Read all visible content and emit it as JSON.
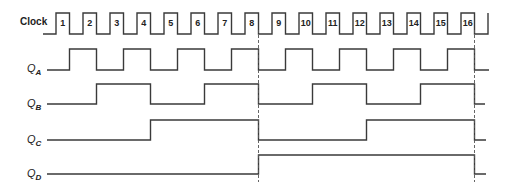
{
  "clock": {
    "label": "Clock",
    "pulse_numbers": [
      "1",
      "2",
      "3",
      "4",
      "5",
      "6",
      "7",
      "8",
      "9",
      "10",
      "11",
      "12",
      "13",
      "14",
      "15",
      "16"
    ]
  },
  "signals": [
    {
      "name": "Q",
      "subscript": "A",
      "toggles_every_pulses": 1
    },
    {
      "name": "Q",
      "subscript": "B",
      "toggles_every_pulses": 2
    },
    {
      "name": "Q",
      "subscript": "C",
      "toggles_every_pulses": 4
    },
    {
      "name": "Q",
      "subscript": "D",
      "toggles_every_pulses": 8
    }
  ],
  "markers": {
    "dashed_lines_after_pulses": [
      8,
      16
    ]
  },
  "geometry": {
    "clock_start_x": 43,
    "first_rise_x": 56,
    "period": 27,
    "pulse_width": 13.5,
    "clock_high_y": 13,
    "clock_low_y": 34,
    "signal_start_x": 47,
    "signal_levels": [
      {
        "high": 49,
        "low": 70,
        "end_x": 489
      },
      {
        "high": 84,
        "low": 104,
        "end_x": 485
      },
      {
        "high": 120,
        "low": 140,
        "end_x": 486
      },
      {
        "high": 155,
        "low": 174,
        "end_x": 486
      }
    ]
  },
  "colors": {
    "line": "#3a3a3a",
    "background": "#ffffff"
  }
}
